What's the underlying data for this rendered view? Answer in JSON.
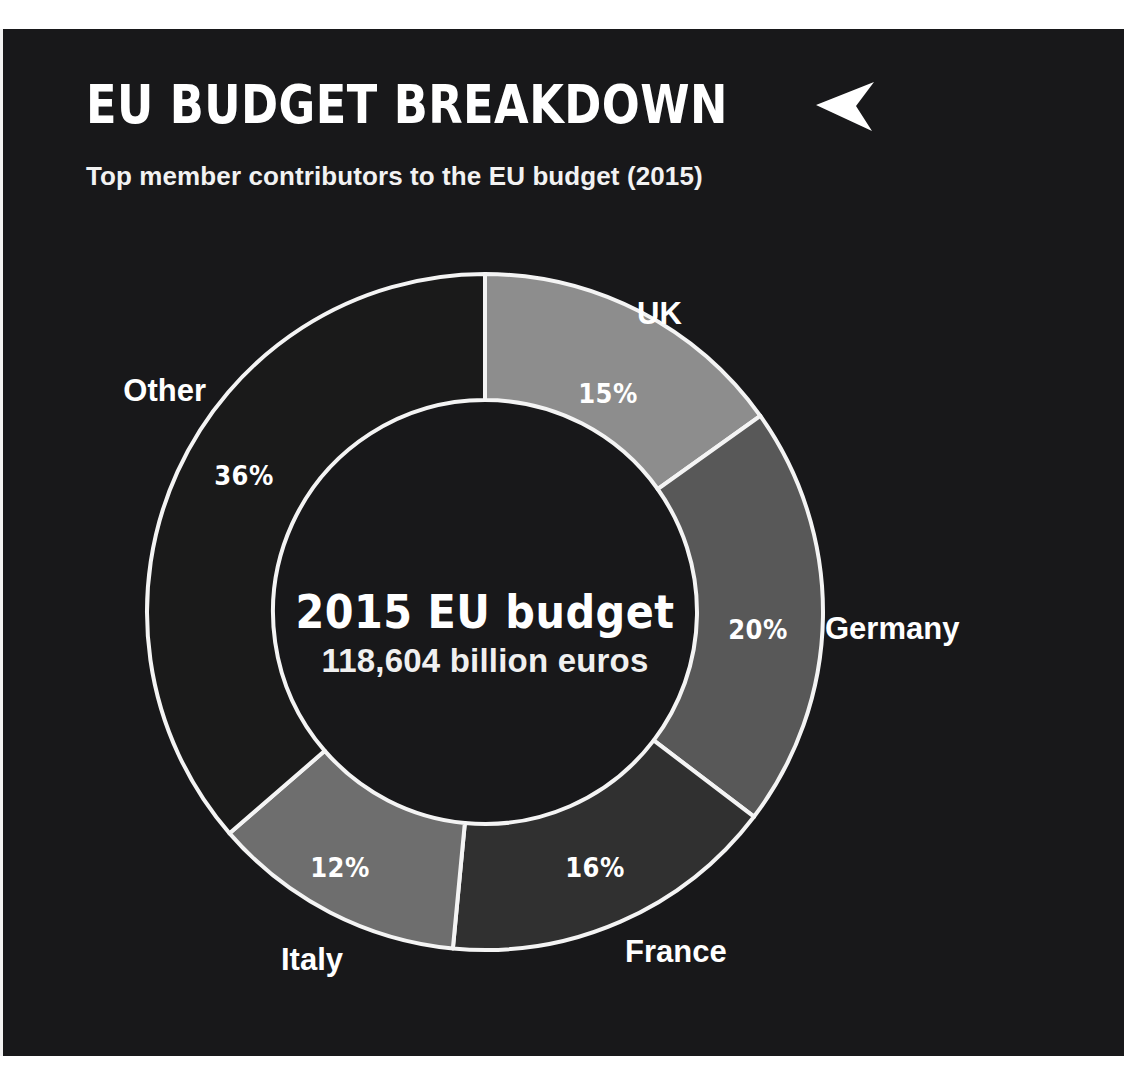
{
  "header": {
    "title": "EU BUDGET BREAKDOWN",
    "title_arrow_icon": "left-arrowhead-icon",
    "subtitle": "Top member contributors to the EU budget (2015)"
  },
  "center": {
    "headline": "2015 EU budget",
    "amount": "118,604 billion euros"
  },
  "colors": {
    "background": "#18181a",
    "page": "#ffffff",
    "text": "#ffffff",
    "slice_stroke": "#f4f4f4",
    "uk": "#8d8d8d",
    "germany": "#585858",
    "france": "#303030",
    "italy": "#6e6e6e",
    "other": "#1a1a1a"
  },
  "chart_data": {
    "type": "pie",
    "variant": "donut",
    "title": "EU BUDGET BREAKDOWN",
    "subtitle": "Top member contributors to the EU budget (2015)",
    "center_label": "2015 EU budget",
    "center_value": "118,604 billion euros",
    "total_value": 118604,
    "unit": "billion euros",
    "year": 2015,
    "start_angle_deg": 0,
    "direction": "clockwise",
    "legend": "labels-outside-slices",
    "categories": [
      "UK",
      "Germany",
      "France",
      "Italy",
      "Other"
    ],
    "values": [
      15,
      20,
      16,
      12,
      36
    ],
    "value_labels": [
      "15%",
      "20%",
      "16%",
      "12%",
      "36%"
    ],
    "colors": [
      "#8d8d8d",
      "#585858",
      "#303030",
      "#6e6e6e",
      "#1a1a1a"
    ],
    "slices": [
      {
        "name": "UK",
        "value": 15,
        "label": "15%",
        "color": "#8d8d8d",
        "pct_x": 608,
        "pct_y": 366,
        "cat_x": 637,
        "cat_y": 287,
        "cat_anchor": "start"
      },
      {
        "name": "Germany",
        "value": 20,
        "label": "20%",
        "color": "#585858",
        "pct_x": 758,
        "pct_y": 602,
        "cat_x": 825,
        "cat_y": 602,
        "cat_anchor": "start"
      },
      {
        "name": "France",
        "value": 16,
        "label": "16%",
        "color": "#303030",
        "pct_x": 595,
        "pct_y": 840,
        "cat_x": 625,
        "cat_y": 925,
        "cat_anchor": "start"
      },
      {
        "name": "Italy",
        "value": 12,
        "label": "12%",
        "color": "#6e6e6e",
        "pct_x": 340,
        "pct_y": 840,
        "cat_x": 343,
        "cat_y": 933,
        "cat_anchor": "end"
      },
      {
        "name": "Other",
        "value": 36,
        "label": "36%",
        "color": "#1a1a1a",
        "pct_x": 244,
        "pct_y": 448,
        "cat_x": 206,
        "cat_y": 364,
        "cat_anchor": "end"
      }
    ]
  }
}
